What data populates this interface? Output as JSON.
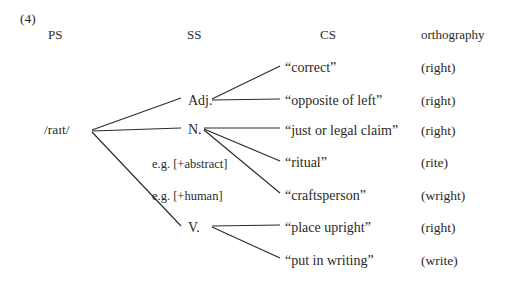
{
  "figure": {
    "number": "(4)",
    "columns": [
      {
        "label": "PS",
        "x": 48,
        "y": 35
      },
      {
        "label": "SS",
        "x": 187,
        "y": 35
      },
      {
        "label": "CS",
        "x": 320,
        "y": 35
      },
      {
        "label": "orthography",
        "x": 421,
        "y": 35
      }
    ]
  },
  "ps": {
    "items": [
      {
        "label": "/raɪt/",
        "x": 44,
        "y": 130
      }
    ]
  },
  "ss": {
    "items": [
      {
        "label": "Adj.",
        "x": 188,
        "y": 101,
        "kind": "category"
      },
      {
        "label": "N.",
        "x": 188,
        "y": 130,
        "kind": "category"
      },
      {
        "label": "e.g. [+abstract]",
        "x": 152,
        "y": 165,
        "kind": "feature"
      },
      {
        "label": "e.g. [+human]",
        "x": 152,
        "y": 197,
        "kind": "feature"
      },
      {
        "label": "V.",
        "x": 188,
        "y": 228,
        "kind": "category"
      }
    ]
  },
  "cs": {
    "items": [
      {
        "label": "“correct”",
        "x": 285,
        "y": 68
      },
      {
        "label": "“opposite of left”",
        "x": 285,
        "y": 101
      },
      {
        "label": "“just or legal claim”",
        "x": 285,
        "y": 131
      },
      {
        "label": "“ritual”",
        "x": 285,
        "y": 163
      },
      {
        "label": "“craftsperson”",
        "x": 285,
        "y": 196
      },
      {
        "label": "“place upright”",
        "x": 285,
        "y": 228
      },
      {
        "label": "“put in writing”",
        "x": 285,
        "y": 261
      }
    ]
  },
  "orthography": {
    "items": [
      {
        "label": "(right)",
        "x": 421,
        "y": 68
      },
      {
        "label": "(right)",
        "x": 421,
        "y": 101
      },
      {
        "label": "(right)",
        "x": 421,
        "y": 131
      },
      {
        "label": "(rite)",
        "x": 421,
        "y": 163
      },
      {
        "label": "(wright)",
        "x": 421,
        "y": 196
      },
      {
        "label": "(right)",
        "x": 421,
        "y": 228
      },
      {
        "label": "(write)",
        "x": 421,
        "y": 261
      }
    ]
  },
  "edges": {
    "color": "#2b2b2b",
    "lines": [
      {
        "from": "ps-raɪt",
        "to": "ss-adj",
        "x1": 92,
        "y1": 130,
        "x2": 181,
        "y2": 98
      },
      {
        "from": "ps-raɪt",
        "to": "ss-n",
        "x1": 92,
        "y1": 131,
        "x2": 181,
        "y2": 128
      },
      {
        "from": "ps-raɪt",
        "to": "ss-v",
        "x1": 92,
        "y1": 132,
        "x2": 181,
        "y2": 226
      },
      {
        "from": "ss-adj",
        "to": "cs-correct",
        "x1": 212,
        "y1": 99,
        "x2": 280,
        "y2": 66
      },
      {
        "from": "ss-adj",
        "to": "cs-opposite-left",
        "x1": 212,
        "y1": 100,
        "x2": 280,
        "y2": 99
      },
      {
        "from": "ss-n",
        "to": "cs-legal-claim",
        "x1": 204,
        "y1": 128,
        "x2": 280,
        "y2": 128
      },
      {
        "from": "ss-n",
        "to": "cs-ritual",
        "x1": 204,
        "y1": 129,
        "x2": 280,
        "y2": 161
      },
      {
        "from": "ss-n",
        "to": "cs-craftsperson",
        "x1": 204,
        "y1": 130,
        "x2": 280,
        "y2": 193
      },
      {
        "from": "ss-v",
        "to": "cs-place-upright",
        "x1": 212,
        "y1": 226,
        "x2": 280,
        "y2": 225
      },
      {
        "from": "ss-v",
        "to": "cs-put-in-writing",
        "x1": 212,
        "y1": 227,
        "x2": 280,
        "y2": 258
      }
    ]
  }
}
